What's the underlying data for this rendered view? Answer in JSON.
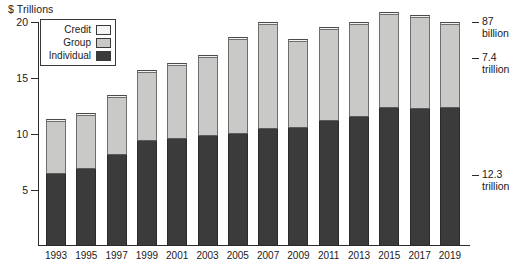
{
  "chart_data": {
    "type": "bar",
    "subtype": "stacked-bar",
    "title": "",
    "ylabel": "$ Trillions",
    "xlabel": "",
    "ylim": [
      0,
      20
    ],
    "yticks": [
      5,
      10,
      15,
      20
    ],
    "grid": false,
    "legend_position": "top-left",
    "categories": [
      "1993",
      "1995",
      "1997",
      "1999",
      "2001",
      "2003",
      "2005",
      "2007",
      "2009",
      "2011",
      "2013",
      "2015",
      "2017",
      "2019"
    ],
    "series": [
      {
        "name": "Individual",
        "color": "#3b3b3b",
        "values": [
          6.4,
          6.8,
          8.1,
          9.3,
          9.5,
          9.8,
          10.0,
          10.4,
          10.5,
          11.1,
          11.5,
          12.3,
          12.2,
          12.3
        ]
      },
      {
        "name": "Group",
        "color": "#c9c9c7",
        "values": [
          4.6,
          4.8,
          5.1,
          6.1,
          6.6,
          7.0,
          8.4,
          9.3,
          7.7,
          8.2,
          8.2,
          8.3,
          8.2,
          7.4
        ]
      },
      {
        "name": "Credit",
        "color": "#f2f2f0",
        "values": [
          0.15,
          0.15,
          0.2,
          0.2,
          0.2,
          0.2,
          0.2,
          0.2,
          0.2,
          0.2,
          0.2,
          0.2,
          0.15,
          0.087
        ]
      }
    ],
    "totals": [
      11.15,
      11.75,
      13.4,
      15.6,
      16.3,
      17.0,
      18.6,
      19.9,
      18.4,
      19.5,
      19.9,
      20.8,
      20.55,
      19.8
    ],
    "annotations": [
      {
        "label_line1": "87",
        "label_line2": "billion",
        "series": "Credit",
        "year": "2019"
      },
      {
        "label_line1": "7.4",
        "label_line2": "trillion",
        "series": "Group",
        "year": "2019"
      },
      {
        "label_line1": "12.3",
        "label_line2": "trillion",
        "series": "Individual",
        "year": "2019"
      }
    ]
  },
  "legend": {
    "items": [
      {
        "label": "Credit",
        "swatch": "credit"
      },
      {
        "label": "Group",
        "swatch": "group"
      },
      {
        "label": "Individual",
        "swatch": "individual"
      }
    ]
  },
  "axis": {
    "y_title": "$ Trillions",
    "y_tick_labels": [
      "20",
      "15",
      "10",
      "5"
    ]
  },
  "colors": {
    "credit": "#f2f2f0",
    "group": "#c9c9c7",
    "individual": "#3b3b3b",
    "axis": "#2b2b2b",
    "background": "#ffffff"
  }
}
